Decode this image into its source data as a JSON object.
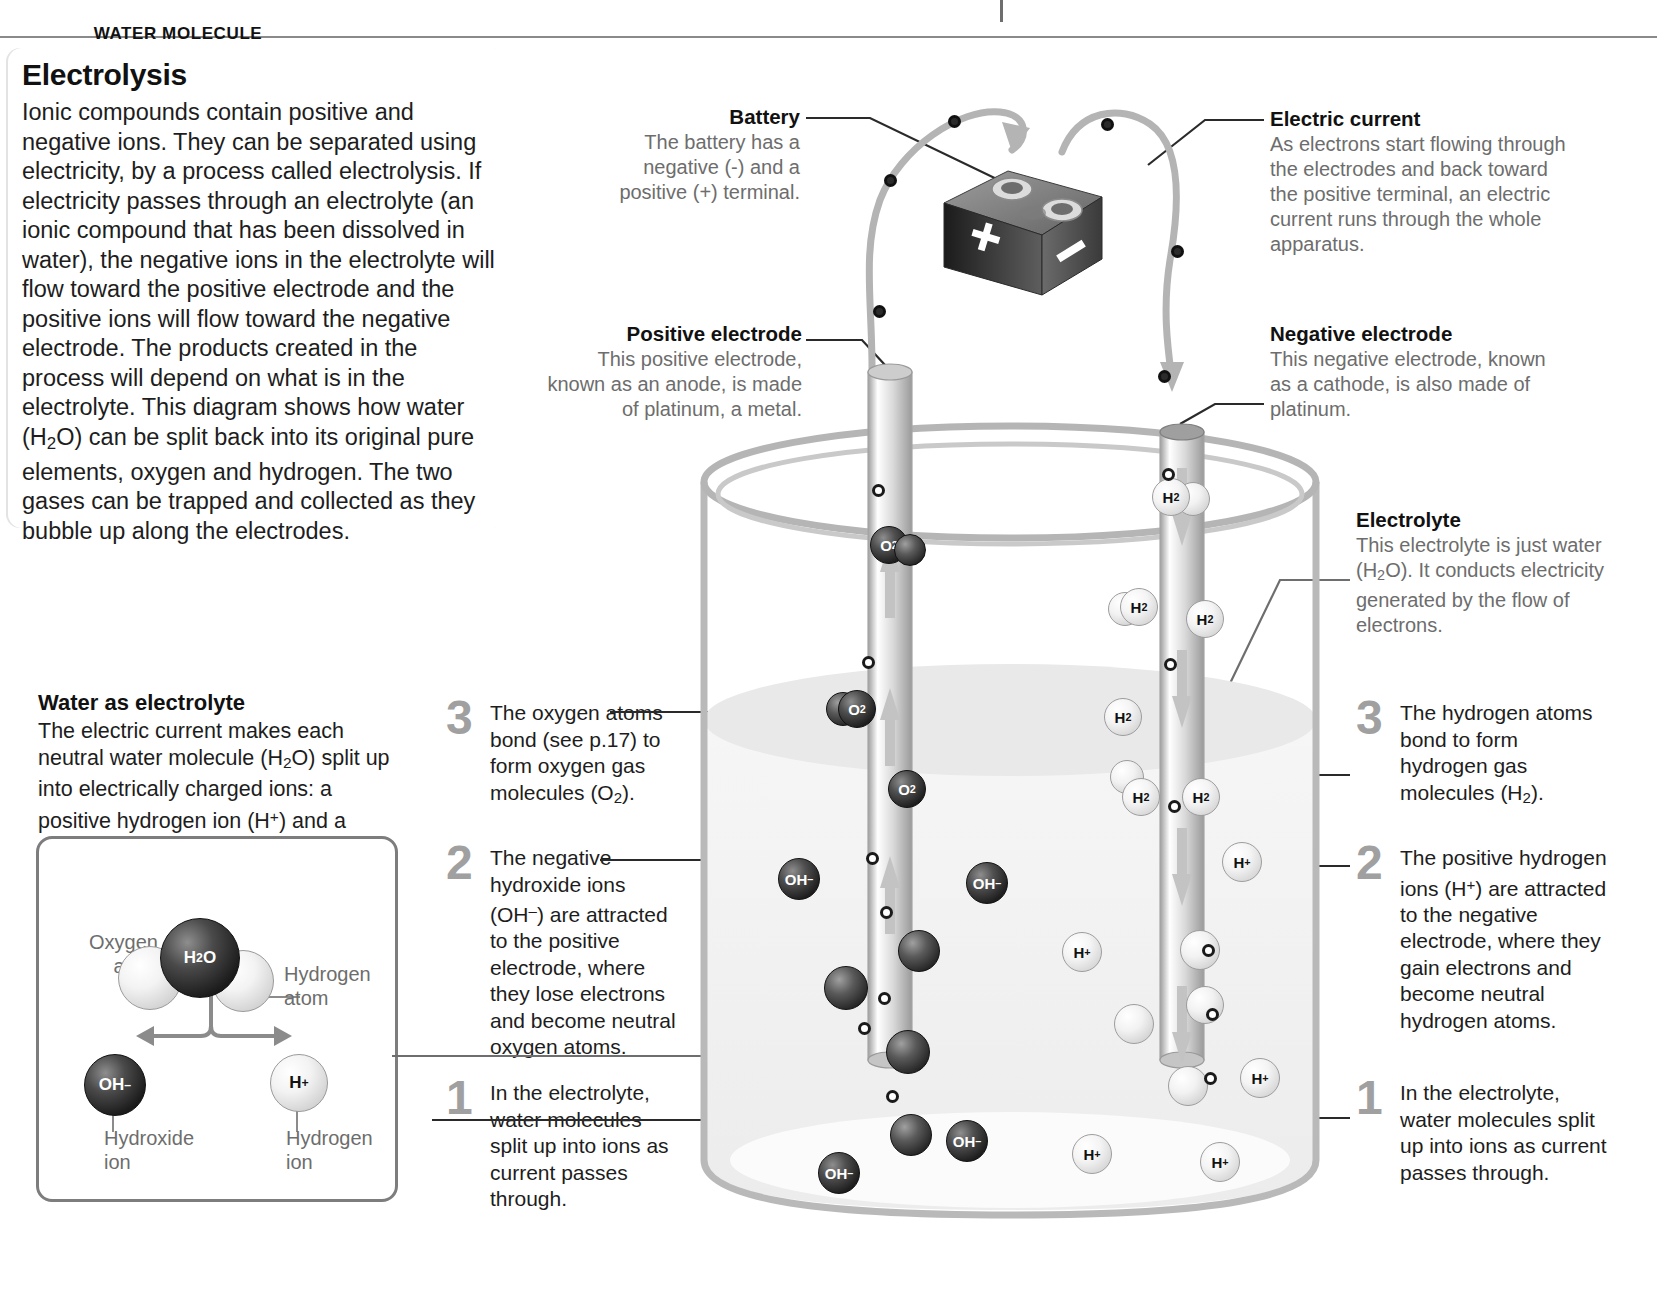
{
  "page": {
    "title": "Electrolysis",
    "intro": "Ionic compounds contain positive and negative ions. They can be separated using electricity, by a process called electrolysis. If electricity passes through an electrolyte (an ionic compound that has been dissolved in water), the negative ions in the electrolyte will flow toward the positive electrode and the positive ions will flow toward the negative electrode. The products created in the process will depend on what is in the electrolyte. This diagram shows how water (H₂O) can be split back into its original pure elements, oxygen and hydrogen. The two gases can be trapped and collected as they bubble up along the electrodes."
  },
  "water_as_electrolyte": {
    "heading": "Water as electrolyte",
    "body": "The electric current makes each neutral water molecule (H₂O) split up into electrically charged ions: a positive hydrogen ion (H⁺) and a negative hydroxide ion (OH⁻)."
  },
  "water_molecule_box": {
    "title": "WATER MOLECULE",
    "oxygen_label": "Oxygen atom",
    "hydrogen_label": "Hydrogen atom",
    "molecule_label": "H₂O",
    "hydroxide_symbol": "OH⁻",
    "hydrogen_ion_symbol": "H⁺",
    "hydroxide_label": "Hydroxide ion",
    "hydrogen_ion_label": "Hydrogen ion"
  },
  "annotations": {
    "battery": {
      "heading": "Battery",
      "body": "The battery has a negative (-) and a positive (+) terminal."
    },
    "electric_current": {
      "heading": "Electric current",
      "body": "As electrons start flowing through the electrodes and back toward the positive terminal, an electric current runs through the whole apparatus."
    },
    "positive_electrode": {
      "heading": "Positive electrode",
      "body": "This positive electrode, known as an anode, is made of platinum, a metal."
    },
    "negative_electrode": {
      "heading": "Negative electrode",
      "body": "This negative electrode, known as a cathode, is also made of platinum."
    },
    "electrolyte": {
      "heading": "Electrolyte",
      "body": "This electrolyte is just water (H₂O). It conducts electricity generated by the flow of electrons."
    }
  },
  "steps_left": [
    {
      "number": "3",
      "text": "The oxygen atoms bond (see p.17) to form oxygen gas molecules (O₂)."
    },
    {
      "number": "2",
      "text": "The negative hydroxide ions (OH⁻) are attracted to the positive electrode, where they lose electrons and become neutral oxygen atoms."
    },
    {
      "number": "1",
      "text": "In the electrolyte, water molecules split up into ions as current passes through."
    }
  ],
  "steps_right": [
    {
      "number": "3",
      "text": "The hydrogen atoms bond to form hydrogen gas molecules (H₂)."
    },
    {
      "number": "2",
      "text": "The positive hydrogen ions (H⁺) are attracted to the negative electrode, where they gain electrons and become neutral hydrogen atoms."
    },
    {
      "number": "1",
      "text": "In the electrolyte, water molecules split up into ions as current passes through."
    }
  ],
  "battery_graphic": {
    "plus_symbol": "+",
    "minus_symbol": "–"
  },
  "molecules": {
    "oxygen_gas": "O₂",
    "hydrogen_gas": "H₂",
    "hydroxide_ion": "OH⁻",
    "hydrogen_ion": "H⁺"
  },
  "colors": {
    "text": "#1d1d1d",
    "muted": "#6d6d6d",
    "step_number": "#a0a0a0",
    "leader_line": "#8b8b8b",
    "beaker_glass": "#b9b9b9",
    "water_fill": "#f1f1f1"
  }
}
